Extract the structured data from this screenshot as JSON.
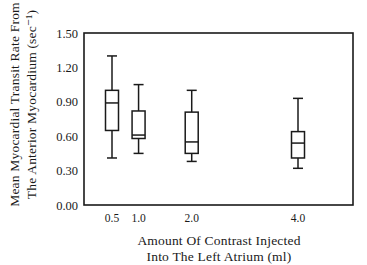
{
  "chart_data": {
    "type": "box",
    "title": "",
    "xlabel": "Amount Of Contrast Injected Into The Left Atrium (ml)",
    "xlabel_lines": [
      "Amount Of Contrast Injected",
      "Into The Left Atrium (ml)"
    ],
    "ylabel": "Mean Myocardial Transit Rate From The Anterior Myocardium (sec-1)",
    "ylabel_lines": [
      "Mean Myocardial Transit Rate From",
      "The Anterior Myocardium (sec⁻¹)"
    ],
    "ylim": [
      0.0,
      1.5
    ],
    "yticks": [
      "0.00",
      "0.30",
      "0.60",
      "0.90",
      "1.20",
      "1.50"
    ],
    "ytick_values": [
      0.0,
      0.3,
      0.6,
      0.9,
      1.2,
      1.5
    ],
    "categories": [
      "0.5",
      "1.0",
      "2.0",
      "4.0"
    ],
    "x_values": [
      0.5,
      1.0,
      2.0,
      4.0
    ],
    "xlim": [
      0.0,
      4.5
    ],
    "grid": false,
    "legend": null,
    "boxes": [
      {
        "x": "0.5",
        "whisker_low": 0.41,
        "q1": 0.65,
        "median": 0.89,
        "q3": 1.0,
        "whisker_high": 1.3
      },
      {
        "x": "1.0",
        "whisker_low": 0.45,
        "q1": 0.58,
        "median": 0.61,
        "q3": 0.82,
        "whisker_high": 1.05
      },
      {
        "x": "2.0",
        "whisker_low": 0.38,
        "q1": 0.45,
        "median": 0.55,
        "q3": 0.81,
        "whisker_high": 1.0
      },
      {
        "x": "4.0",
        "whisker_low": 0.32,
        "q1": 0.41,
        "median": 0.54,
        "q3": 0.64,
        "whisker_high": 0.93
      }
    ]
  },
  "colors": {
    "ink": "#1a1a1a",
    "background": "#ffffff"
  }
}
